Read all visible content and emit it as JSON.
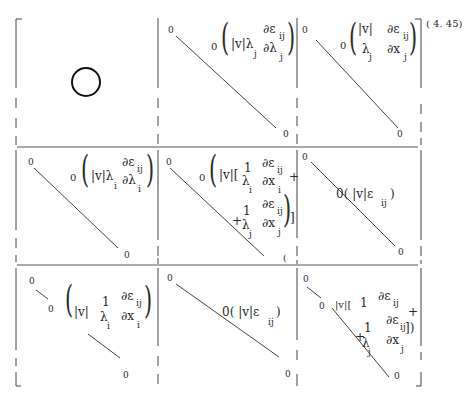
{
  "equation_number": "( 4. 45)",
  "matrix": {
    "rows": 3,
    "cols": 3,
    "cells": [
      [
        {
          "position": "1-1",
          "content": "O",
          "description": "large circle (zero block)"
        },
        {
          "position": "1-2",
          "diag_start": "0",
          "diag_end": "0",
          "term_prefix": "0",
          "term_lead": "|v|λ",
          "lead_sub": "j",
          "frac_num": "∂ε",
          "frac_num_sub": "ij",
          "frac_den": "∂λ",
          "frac_den_sub": "j"
        },
        {
          "position": "1-3",
          "diag_start": "0",
          "diag_end": "0",
          "term_prefix": "0",
          "frac1_num": "|v|",
          "frac1_den": "λ",
          "frac1_den_sub": "j",
          "frac_num": "∂ε",
          "frac_num_sub": "ij",
          "frac_den": "∂x",
          "frac_den_sub": "j"
        }
      ],
      [
        {
          "position": "2-1",
          "diag_start": "0",
          "diag_end": "0",
          "term_prefix": "0",
          "term_lead": "|v|λ",
          "lead_sub": "i",
          "frac_num": "∂ε",
          "frac_num_sub": "ij",
          "frac_den": "∂λ",
          "frac_den_sub": "i"
        },
        {
          "position": "2-2",
          "diag_start": "0",
          "diag_end": "(",
          "term_prefix": "0",
          "term_lead": "|v|[",
          "frac1_num": "1",
          "frac1_den": "λ",
          "frac1_den_sub": "i",
          "frac_num": "∂ε",
          "frac_num_sub": "ij",
          "frac_den": "∂x",
          "frac_den_sub": "i",
          "plus1": "+",
          "plus2": "+",
          "frac2_num": "1",
          "frac2_den": "λ",
          "frac2_den_sub": "j",
          "frac3_num": "∂ε",
          "frac3_num_sub": "ij",
          "frac3_den": "∂x",
          "frac3_den_sub": "j",
          "close": "]"
        },
        {
          "position": "2-3",
          "diag_start": "0",
          "diag_end": "0",
          "term": "0( |v|ε",
          "term_sub": "ij",
          "term_close": ")"
        }
      ],
      [
        {
          "position": "3-1",
          "diag_start": "0",
          "diag_mid": "0",
          "diag_end": "0",
          "term_lead": "|v|",
          "frac1_num": "1",
          "frac1_den": "λ",
          "frac1_den_sub": "i",
          "frac_num": "∂ε",
          "frac_num_sub": "ij",
          "frac_den": "∂x",
          "frac_den_sub": "i"
        },
        {
          "position": "3-2",
          "diag_start": "0",
          "diag_end": "0",
          "term": "0( |v|ε",
          "term_sub": "ij",
          "term_close": ")"
        },
        {
          "position": "3-3",
          "diag_start": "0",
          "diag_mid": "0",
          "diag_end": "0",
          "term_lead": "|v|[",
          "frac1_num": "1",
          "frac_num": "∂ε",
          "frac_num_sub": "ij",
          "plus1": "+",
          "plus2": "+",
          "frac2_num": "1",
          "frac2_den": "λ",
          "frac2_den_sub": "j",
          "frac3_num": "∂ε",
          "frac3_num_sub": "ij",
          "frac3_den": "∂x",
          "frac3_den_sub": "j",
          "close": "])"
        }
      ]
    ]
  }
}
